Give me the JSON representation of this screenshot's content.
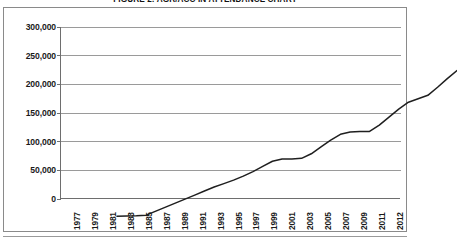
{
  "figure": {
    "title": "FIGURE 2: AGR/ACC IN ATTENDANCE CHART"
  },
  "chart_data": {
    "type": "line",
    "title": "FIGURE 2: AGR/ACC IN ATTENDANCE CHART",
    "xlabel": "",
    "ylabel": "",
    "grid": true,
    "legend": false,
    "ylim": [
      0,
      300000
    ],
    "yticks": [
      0,
      50000,
      100000,
      150000,
      200000,
      250000,
      300000
    ],
    "ytick_labels": [
      "0",
      "50,000",
      "100,000",
      "150,000",
      "200,000",
      "250,000",
      "300,000"
    ],
    "xtick_labels": [
      "1977",
      "1979",
      "1981",
      "1983",
      "1985",
      "1987",
      "1989",
      "1991",
      "1993",
      "1995",
      "1997",
      "1999",
      "2001",
      "2003",
      "2005",
      "2007",
      "2009",
      "2011",
      "2012"
    ],
    "x": [
      1977,
      1978,
      1979,
      1980,
      1981,
      1982,
      1983,
      1984,
      1985,
      1986,
      1987,
      1988,
      1989,
      1990,
      1991,
      1992,
      1993,
      1994,
      1995,
      1996,
      1997,
      1998,
      1999,
      2000,
      2001,
      2002,
      2003,
      2004,
      2005,
      2006,
      2007,
      2008,
      2009,
      2010,
      2011,
      2012
    ],
    "values": [
      3000,
      3500,
      4000,
      5000,
      12000,
      19000,
      26000,
      33000,
      40000,
      47000,
      54000,
      60000,
      66000,
      73000,
      81000,
      90000,
      99000,
      103000,
      103000,
      104000,
      112000,
      124000,
      136000,
      146000,
      150000,
      151000,
      151000,
      162000,
      176000,
      190000,
      202000,
      208000,
      214000,
      228000,
      243000,
      257000
    ],
    "series": [
      {
        "name": "Attendance",
        "color": "#1f1f1f",
        "values": [
          3000,
          3500,
          4000,
          5000,
          12000,
          19000,
          26000,
          33000,
          40000,
          47000,
          54000,
          60000,
          66000,
          73000,
          81000,
          90000,
          99000,
          103000,
          103000,
          104000,
          112000,
          124000,
          136000,
          146000,
          150000,
          151000,
          151000,
          162000,
          176000,
          190000,
          202000,
          208000,
          214000,
          228000,
          243000,
          257000
        ]
      }
    ]
  },
  "colors": {
    "line": "#1f1f1f",
    "grid": "#9a9a9a",
    "axis": "#6e6e6e",
    "frame": "#8a8a8a"
  }
}
